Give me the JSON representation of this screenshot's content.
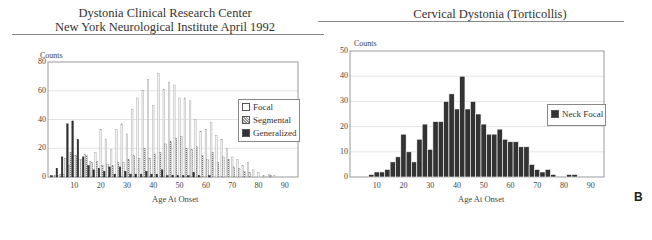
{
  "left": {
    "title_line1": "Dystonia Clinical Research Center",
    "title_line2": "New York Neurological Institute April 1992",
    "ylabel": "Counts",
    "xlabel": "Age At Onset",
    "yticks": [
      "0",
      "20",
      "40",
      "60",
      "80"
    ],
    "xticks": [
      "10",
      "20",
      "30",
      "40",
      "50",
      "60",
      "70",
      "80",
      "90"
    ],
    "legend": [
      "Focal",
      "Segmental",
      "Generalized"
    ]
  },
  "right": {
    "title": "Cervical Dystonia (Torticollis)",
    "ylabel": "Counts",
    "xlabel": "Age At Onset",
    "yticks": [
      "0",
      "10",
      "20",
      "30",
      "40",
      "50"
    ],
    "xticks": [
      "10",
      "20",
      "30",
      "40",
      "50",
      "60",
      "70",
      "80",
      "90"
    ],
    "legend": [
      "Neck Focal"
    ]
  },
  "panel_letter": "B",
  "chart_data": [
    {
      "type": "bar",
      "title": "Dystonia Clinical Research Center — New York Neurological Institute April 1992",
      "xlabel": "Age At Onset",
      "ylabel": "Counts",
      "ylim": [
        0,
        80
      ],
      "xlim": [
        0,
        95
      ],
      "grid": true,
      "legend_position": "right",
      "x": [
        2,
        4,
        6,
        8,
        10,
        12,
        14,
        16,
        18,
        20,
        22,
        24,
        26,
        28,
        30,
        32,
        34,
        36,
        38,
        40,
        42,
        44,
        46,
        48,
        50,
        52,
        54,
        56,
        58,
        60,
        62,
        64,
        66,
        68,
        70,
        72,
        74,
        76,
        78,
        80,
        82,
        84,
        86
      ],
      "series": [
        {
          "name": "Focal",
          "values": [
            0,
            1,
            2,
            8,
            15,
            12,
            16,
            11,
            17,
            33,
            26,
            19,
            33,
            37,
            30,
            47,
            55,
            60,
            68,
            50,
            72,
            61,
            66,
            64,
            55,
            55,
            53,
            40,
            32,
            33,
            38,
            29,
            26,
            20,
            14,
            12,
            8,
            10,
            5,
            3,
            1,
            2,
            1
          ]
        },
        {
          "name": "Segmental",
          "values": [
            1,
            2,
            13,
            17,
            15,
            12,
            15,
            10,
            11,
            8,
            9,
            8,
            10,
            10,
            12,
            15,
            13,
            20,
            13,
            16,
            17,
            23,
            25,
            27,
            28,
            20,
            19,
            21,
            15,
            12,
            17,
            10,
            14,
            12,
            7,
            6,
            4,
            3,
            0,
            0,
            0,
            1,
            0
          ]
        },
        {
          "name": "Generalized",
          "values": [
            1,
            6,
            14,
            37,
            39,
            26,
            14,
            8,
            5,
            6,
            4,
            7,
            2,
            7,
            4,
            2,
            2,
            2,
            4,
            2,
            2,
            5,
            1,
            1,
            1,
            1,
            1,
            3,
            1,
            0,
            1,
            0,
            0,
            0,
            0,
            0,
            0,
            0,
            0,
            0,
            0,
            0,
            0
          ]
        }
      ]
    },
    {
      "type": "bar",
      "title": "Cervical Dystonia (Torticollis)",
      "xlabel": "Age At Onset",
      "ylabel": "Counts",
      "ylim": [
        0,
        50
      ],
      "xlim": [
        0,
        95
      ],
      "grid": true,
      "legend_position": "right",
      "x": [
        8,
        10,
        12,
        14,
        16,
        18,
        20,
        22,
        24,
        26,
        28,
        30,
        32,
        34,
        36,
        38,
        40,
        42,
        44,
        46,
        48,
        50,
        52,
        54,
        56,
        58,
        60,
        62,
        64,
        66,
        68,
        70,
        72,
        74,
        76,
        78,
        80,
        82,
        84
      ],
      "series": [
        {
          "name": "Neck Focal",
          "values": [
            1,
            2,
            2,
            3,
            6,
            8,
            17,
            10,
            6,
            15,
            21,
            11,
            22,
            22,
            30,
            33,
            27,
            40,
            27,
            30,
            25,
            21,
            17,
            17,
            19,
            15,
            14,
            14,
            12,
            12,
            5,
            3,
            2,
            3,
            1,
            0,
            0,
            1,
            1
          ]
        }
      ]
    }
  ]
}
